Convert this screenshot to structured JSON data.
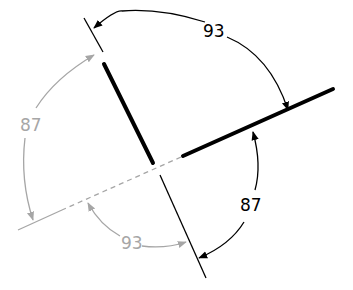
{
  "diagram": {
    "colors": {
      "primary": "#000000",
      "secondary": "#a6a6a6",
      "background": "#ffffff"
    },
    "labels": {
      "top_angle": "93",
      "right_angle": "87",
      "left_angle": "87",
      "bottom_angle": "93"
    }
  }
}
